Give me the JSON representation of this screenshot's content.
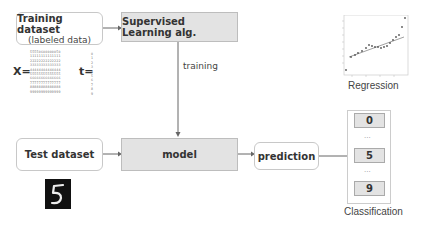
{
  "nodes": {
    "training_dataset": {
      "title": "Training dataset",
      "subtitle": "(labeled data)"
    },
    "supervised_alg": {
      "label": "Supervised Learning alg."
    },
    "test_dataset": {
      "label": "Test dataset"
    },
    "model": {
      "label": "model"
    },
    "prediction": {
      "label": "prediction"
    }
  },
  "edges": {
    "training_label": "training"
  },
  "data_notation": {
    "x_label": "X=",
    "t_label": "t=",
    "x_rows": [
      "55550600000050",
      "11111111111111",
      "22222222222222",
      "33333333333333",
      "44444444444444",
      "55555555555555",
      "66666666666666",
      "77777777777777",
      "88888888888888",
      "99999999999999"
    ],
    "t_values": [
      "0",
      "1",
      "2",
      "3",
      "4",
      "5",
      "6",
      "7",
      "8",
      "9"
    ]
  },
  "regression": {
    "caption": "Regression"
  },
  "classification": {
    "caption": "Classification",
    "classes": [
      "0",
      "5",
      "9"
    ],
    "ellipsis": "..."
  },
  "test_sample": {
    "digit": "5"
  }
}
